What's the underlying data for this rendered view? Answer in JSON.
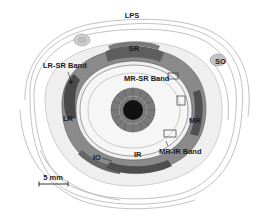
{
  "figure": {
    "type": "anatomical-diagram",
    "colors": {
      "background": "#ffffff",
      "ink": "#1a1a1a",
      "outline": "#9a9a9a",
      "muscle_dark": "#5a5a5a",
      "muscle_mid": "#8c8c8c",
      "tissue_light": "#d6d6d6",
      "iris": "#6e6e6e",
      "pupil": "#111111"
    }
  },
  "labels": {
    "lps": "LPS",
    "sr": "SR",
    "lr_sr_band": "LR-SR Band",
    "mr_sr_band": "MR-SR Band",
    "so": "SO",
    "lr": "LR",
    "mr": "MR",
    "io": "IO",
    "ir": "IR",
    "mr_ir_band": "MR-IR Band"
  },
  "scale_bar": {
    "label": "5 mm"
  }
}
